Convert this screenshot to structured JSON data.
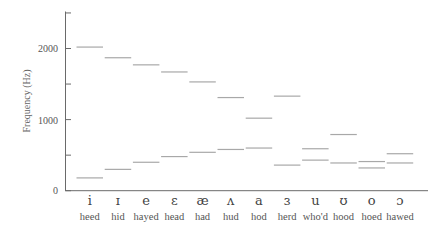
{
  "chart_data": {
    "type": "bar",
    "title": "",
    "xlabel": "",
    "ylabel": "Frequency (Hz)",
    "ylim": [
      0,
      2500
    ],
    "yticks": [
      0,
      500,
      1000,
      1500,
      2000,
      2500
    ],
    "ytick_labels": [
      "0",
      "",
      "1000",
      "",
      "2000",
      ""
    ],
    "grid": false,
    "legend": null,
    "categories": [
      "heed",
      "hid",
      "hayed",
      "head",
      "had",
      "hud",
      "hod",
      "herd",
      "who'd",
      "hood",
      "hoed",
      "hawed"
    ],
    "symbols": [
      "i",
      "ɪ",
      "e",
      "ɛ",
      "æ",
      "ʌ",
      "a",
      "ɜ",
      "u",
      "ʊ",
      "o",
      "ɔ"
    ],
    "series": [
      {
        "name": "F1",
        "values": [
          180,
          300,
          400,
          480,
          540,
          580,
          600,
          360,
          430,
          390,
          320,
          390
        ]
      },
      {
        "name": "F2",
        "values": [
          2020,
          1870,
          1770,
          1670,
          1530,
          1310,
          1020,
          1330,
          590,
          790,
          410,
          520
        ]
      }
    ]
  },
  "axis": {
    "y_tick_labels": {
      "zero": "0",
      "thousand": "1000",
      "two_thousand": "2000"
    },
    "y_title": "Frequency (Hz)"
  }
}
